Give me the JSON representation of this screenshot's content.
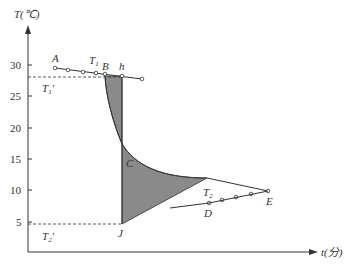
{
  "diagram": {
    "y_axis_label": "T(℃)",
    "x_axis_label": "t(分)",
    "y_ticks": [
      "30",
      "25",
      "20",
      "15",
      "10",
      "5"
    ],
    "points": {
      "A": "A",
      "B": "B",
      "h": "h",
      "C": "C",
      "D": "D",
      "E": "E",
      "J": "J"
    },
    "temperature_labels": {
      "T1": "T",
      "T1_sub": "1",
      "T1_prime": "T",
      "T1_prime_sub": "1",
      "T2": "T",
      "T2_sub": "2",
      "T2_prime": "T",
      "T2_prime_sub": "2"
    },
    "colors": {
      "line": "#333333",
      "shade": "#8a8a8a",
      "axis": "#333333"
    }
  }
}
